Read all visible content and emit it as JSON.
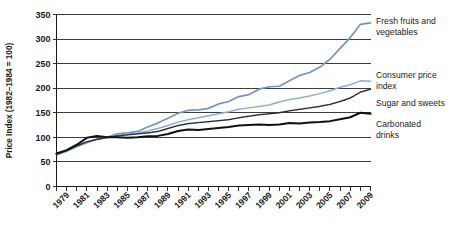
{
  "chart_data": {
    "type": "line",
    "title": "",
    "xlabel": "",
    "ylabel": "Price Index (1982–1984 = 100)",
    "ylim": [
      0,
      350
    ],
    "xlim": [
      1978,
      2009
    ],
    "grid": true,
    "legend_position": "right",
    "y_ticks": [
      "0",
      "50",
      "100",
      "150",
      "200",
      "250",
      "300",
      "350"
    ],
    "y_tick_values": [
      0,
      50,
      100,
      150,
      200,
      250,
      300,
      350
    ],
    "x_ticks": [
      "1979",
      "1981",
      "1983",
      "1985",
      "1987",
      "1989",
      "1991",
      "1993",
      "1995",
      "1997",
      "1999",
      "2001",
      "2003",
      "2005",
      "2007",
      "2009"
    ],
    "x_tick_values": [
      1979,
      1981,
      1983,
      1985,
      1987,
      1989,
      1991,
      1993,
      1995,
      1997,
      1999,
      2001,
      2003,
      2005,
      2007,
      2009
    ],
    "x": [
      1978,
      1979,
      1980,
      1981,
      1982,
      1983,
      1984,
      1985,
      1986,
      1987,
      1988,
      1989,
      1990,
      1991,
      1992,
      1993,
      1994,
      1995,
      1996,
      1997,
      1998,
      1999,
      2000,
      2001,
      2002,
      2003,
      2004,
      2005,
      2006,
      2007,
      2008,
      2009
    ],
    "series": [
      {
        "name": "Fresh fruits and vegetables",
        "color": "#6d97c4",
        "style": "solid",
        "values": [
          64,
          72,
          81,
          89,
          96,
          100,
          107,
          109,
          112,
          121,
          129,
          139,
          149,
          155,
          156,
          159,
          168,
          173,
          183,
          187,
          198,
          203,
          204,
          215,
          226,
          232,
          243,
          259,
          281,
          303,
          330,
          333
        ]
      },
      {
        "name": "Consumer price index",
        "color": "#8fadd0",
        "style": "solid",
        "values": [
          65,
          72,
          82,
          90,
          96,
          100,
          103,
          107,
          109,
          113,
          118,
          124,
          131,
          136,
          140,
          144,
          148,
          152,
          157,
          160,
          163,
          166,
          172,
          177,
          180,
          184,
          189,
          195,
          202,
          207,
          215,
          214
        ]
      },
      {
        "name": "Sugar and sweets",
        "color": "#2d2d2d",
        "style": "dotted",
        "values": [
          66,
          73,
          83,
          91,
          96,
          100,
          103,
          105,
          107,
          109,
          112,
          118,
          124,
          128,
          130,
          132,
          134,
          136,
          140,
          143,
          146,
          148,
          150,
          154,
          157,
          160,
          163,
          167,
          173,
          180,
          192,
          198
        ]
      },
      {
        "name": "Carbonated drinks",
        "color": "#111111",
        "style": "solid",
        "values": [
          67,
          74,
          85,
          99,
          103,
          100,
          100,
          99,
          100,
          102,
          103,
          107,
          113,
          116,
          115,
          117,
          119,
          121,
          124,
          125,
          126,
          125,
          126,
          129,
          128,
          130,
          131,
          133,
          137,
          141,
          150,
          148
        ]
      }
    ]
  },
  "legend": {
    "items": [
      {
        "label_line1": "Fresh fruits and",
        "label_line2": "vegetables"
      },
      {
        "label_line1": "Consumer price",
        "label_line2": "index"
      },
      {
        "label_line1": "Sugar and sweets",
        "label_line2": ""
      },
      {
        "label_line1": "Carbonated",
        "label_line2": "drinks"
      }
    ]
  }
}
